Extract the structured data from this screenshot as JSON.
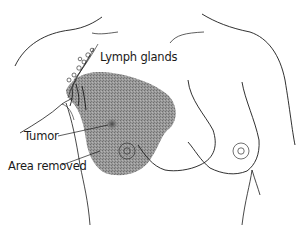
{
  "figure": {
    "type": "anatomical-illustration"
  },
  "labels": {
    "lymph_glands": "Lymph glands",
    "tumor": "Tumor",
    "area_removed": "Area removed"
  },
  "colors": {
    "line": "#1a1a1a",
    "shaded_area": "#8c8c8c",
    "tumor": "#555555",
    "background": "#ffffff"
  }
}
